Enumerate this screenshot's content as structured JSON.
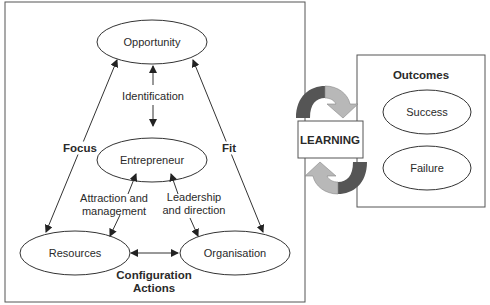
{
  "diagram": {
    "nodes": {
      "opportunity": "Opportunity",
      "entrepreneur": "Entrepreneur",
      "resources": "Resources",
      "organisation": "Organisation"
    },
    "edge_labels": {
      "identification": "Identification",
      "focus": "Focus",
      "fit": "Fit",
      "attraction_line1": "Attraction and",
      "attraction_line2": "management",
      "leadership_line1": "Leadership",
      "leadership_line2": "and direction",
      "configuration_line1": "Configuration",
      "configuration_line2": "Actions"
    },
    "learning": {
      "label": "LEARNING"
    },
    "outcomes": {
      "title": "Outcomes",
      "items": [
        "Success",
        "Failure"
      ]
    },
    "colors": {
      "line": "#333333",
      "arrow_dark": "#555555",
      "arrow_light": "#b8b8b8",
      "frame": "#555555"
    }
  }
}
